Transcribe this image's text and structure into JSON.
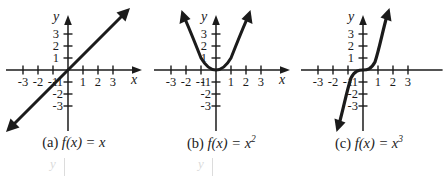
{
  "figure": {
    "background_color": "#ffffff",
    "ink_color": "#1b1b1b",
    "panels": [
      {
        "id": "panel-a",
        "caption_label": "(a)",
        "caption_function": "f(x) = x",
        "caption_base": "f(x) = x",
        "caption_exponent": "",
        "chart": {
          "type": "line",
          "title": "f(x) = x",
          "xlabel": "x",
          "ylabel": "y",
          "xlim": [
            -4.2,
            4.2
          ],
          "ylim": [
            -4.2,
            4.2
          ],
          "xticks": [
            -3,
            -2,
            -1,
            1,
            2,
            3
          ],
          "yticks": [
            -3,
            -2,
            -1,
            1,
            2,
            3
          ],
          "xtick_labels": [
            "-3",
            "-2",
            "-1",
            "1",
            "2",
            "3"
          ],
          "ytick_labels": [
            "-3",
            "-2",
            "-1",
            "1",
            "2",
            "3"
          ],
          "grid": false,
          "legend": "none",
          "arrowheads": "both-ends",
          "series": [
            {
              "name": "f(x) = x",
              "expression": "y = x",
              "x": [
                -3.6,
                -3,
                -2,
                -1,
                0,
                1,
                2,
                3,
                3.6
              ],
              "y": [
                -3.6,
                -3,
                -2,
                -1,
                0,
                1,
                2,
                3,
                3.6
              ]
            }
          ]
        }
      },
      {
        "id": "panel-b",
        "caption_label": "(b)",
        "caption_function": "f(x) = x²",
        "caption_base": "f(x) = x",
        "caption_exponent": "2",
        "chart": {
          "type": "line",
          "title": "f(x) = x^2",
          "xlabel": "x",
          "ylabel": "y",
          "xlim": [
            -4.2,
            4.2
          ],
          "ylim": [
            -4.2,
            4.2
          ],
          "xticks": [
            -3,
            -2,
            -1,
            1,
            2,
            3
          ],
          "yticks": [
            -3,
            -2,
            -1,
            1,
            2,
            3
          ],
          "xtick_labels": [
            "-3",
            "-2",
            "-1",
            "1",
            "2",
            "3"
          ],
          "ytick_labels": [
            "-3",
            "-2",
            "-1",
            "1",
            "2",
            "3"
          ],
          "grid": false,
          "legend": "none",
          "arrowheads": "both-ends",
          "series": [
            {
              "name": "f(x) = x^2",
              "expression": "y = x*x",
              "x": [
                -2.05,
                -1.75,
                -1.5,
                -1.25,
                -1,
                -0.75,
                -0.5,
                -0.25,
                0,
                0.25,
                0.5,
                0.75,
                1,
                1.25,
                1.5,
                1.75,
                2.05
              ],
              "y": [
                4.2,
                3.06,
                2.25,
                1.56,
                1,
                0.56,
                0.25,
                0.06,
                0,
                0.06,
                0.25,
                0.56,
                1,
                1.56,
                2.25,
                3.06,
                4.2
              ]
            }
          ]
        }
      },
      {
        "id": "panel-c",
        "caption_label": "(c)",
        "caption_function": "f(x) = x³",
        "caption_base": "f(x) = x",
        "caption_exponent": "3",
        "chart": {
          "type": "line",
          "title": "f(x) = x^3",
          "xlabel": "x",
          "ylabel": "y",
          "xlim": [
            -4.2,
            4.2
          ],
          "ylim": [
            -4.2,
            4.2
          ],
          "xticks": [
            -3,
            -2,
            -1,
            1,
            2,
            3
          ],
          "yticks": [
            -3,
            -2,
            -1,
            1,
            2,
            3
          ],
          "xtick_labels": [
            "-3",
            "-2",
            "-1",
            "1",
            "2",
            "3"
          ],
          "ytick_labels": [
            "-3",
            "-2",
            "-1",
            "1",
            "2",
            "3"
          ],
          "grid": false,
          "legend": "none",
          "arrowheads": "both-ends",
          "series": [
            {
              "name": "f(x) = x^3",
              "expression": "y = x*x*x",
              "x": [
                -1.58,
                -1.4,
                -1.2,
                -1,
                -0.8,
                -0.6,
                -0.4,
                -0.2,
                0,
                0.2,
                0.4,
                0.6,
                0.8,
                1,
                1.2,
                1.4,
                1.58
              ],
              "y": [
                -3.94,
                -2.74,
                -1.73,
                -1,
                -0.51,
                -0.22,
                -0.06,
                -0.01,
                0,
                0.01,
                0.06,
                0.22,
                0.51,
                1,
                1.73,
                2.74,
                3.94
              ]
            }
          ]
        }
      }
    ],
    "cropped_partials": [
      {
        "label": "y",
        "x": 52
      },
      {
        "label": "y",
        "x": 200
      }
    ]
  }
}
